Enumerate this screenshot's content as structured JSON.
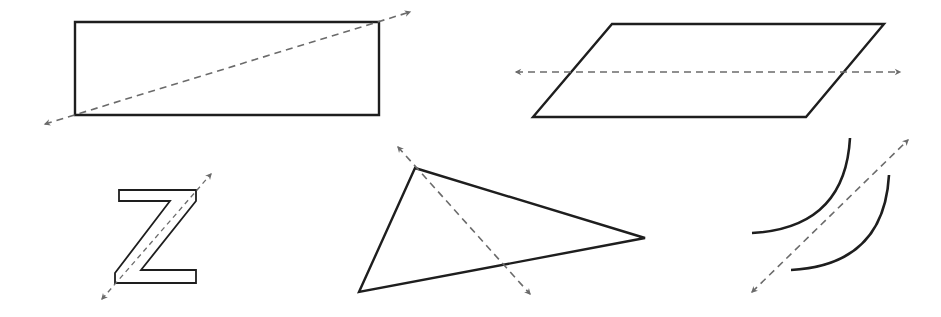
{
  "diagram": {
    "colors": {
      "background": "#ffffff",
      "shape_stroke": "#1e1e1e",
      "dashed_line": "#6b6b6b",
      "arrowhead": "#6b6b6b"
    },
    "figures": [
      {
        "id": "rectangle",
        "label": "rectangle",
        "points": "75,22 379,22 379,115 75,115",
        "line": {
          "x1": 45,
          "y1": 124,
          "x2": 410,
          "y2": 12,
          "style": "dashed",
          "arrows": "both"
        }
      },
      {
        "id": "parallelogram",
        "label": "parallelogram",
        "points": "612,24 884,24 806,117 533,117",
        "line": {
          "x1": 516,
          "y1": 72,
          "x2": 900,
          "y2": 72,
          "style": "dashed",
          "arrows": "both"
        }
      },
      {
        "id": "letter-z",
        "label": "letter Z",
        "points": "119,190 196,190 196,201 141,270 196,270 196,283 115,283 115,273 170,201 119,201",
        "line": {
          "x1": 102,
          "y1": 299,
          "x2": 211,
          "y2": 174,
          "style": "dashed",
          "arrows": "both"
        }
      },
      {
        "id": "triangle",
        "label": "triangle",
        "points": "415,168 645,238 359,292",
        "line": {
          "x1": 398,
          "y1": 147,
          "x2": 530,
          "y2": 294,
          "style": "dashed",
          "arrows": "both"
        }
      },
      {
        "id": "arcs",
        "label": "pair of arcs",
        "arc_upper": "M 850 138 Q 845 228 752 233",
        "arc_lower": "M 889 175 Q 884 265 791 270",
        "line": {
          "x1": 752,
          "y1": 292,
          "x2": 908,
          "y2": 140,
          "style": "dashed",
          "arrows": "both"
        }
      }
    ]
  }
}
